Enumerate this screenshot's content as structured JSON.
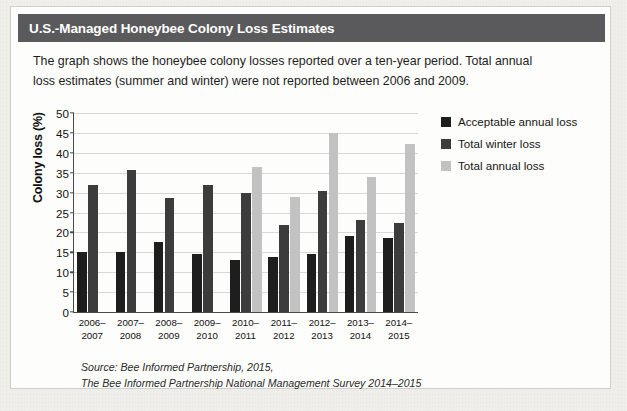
{
  "header": {
    "title": "U.S.-Managed Honeybee Colony Loss Estimates"
  },
  "description": {
    "line1": "The graph shows the honeybee colony losses reported over a ten-year period. Total annual",
    "line2": "loss estimates (summer and winter) were not reported between 2006 and 2009."
  },
  "source": {
    "line1": "Source: Bee Informed Partnership, 2015,",
    "line2": "The Bee Informed Partnership National Management Survey 2014–2015"
  },
  "legend": {
    "items": [
      {
        "label": "Acceptable annual loss",
        "color": "#1e1e1e",
        "key": "acceptable"
      },
      {
        "label": "Total winter loss",
        "color": "#3c3c3c",
        "key": "winter"
      },
      {
        "label": "Total annual loss",
        "color": "#c2c2c2",
        "key": "annual"
      }
    ]
  },
  "chart_data": {
    "type": "bar",
    "title": "U.S.-Managed Honeybee Colony Loss Estimates",
    "xlabel": "",
    "ylabel": "Colony loss (%)",
    "ylim": [
      0,
      50
    ],
    "ytick_step": 5,
    "yticks": [
      0,
      5,
      10,
      15,
      20,
      25,
      30,
      35,
      40,
      45,
      50
    ],
    "ytick_labels": [
      "0",
      "5",
      "10",
      "15",
      "20",
      "25",
      "30",
      "35",
      "40",
      "45",
      "50"
    ],
    "grid": true,
    "legend_position": "right-top",
    "categories": [
      "2006–2007",
      "2007–2008",
      "2008–2009",
      "2009–2010",
      "2010–2011",
      "2011–2012",
      "2012–2013",
      "2013–2014",
      "2014–2015"
    ],
    "category_lines": [
      [
        "2006–",
        "2007"
      ],
      [
        "2007–",
        "2008"
      ],
      [
        "2008–",
        "2009"
      ],
      [
        "2009–",
        "2010"
      ],
      [
        "2010–",
        "2011"
      ],
      [
        "2011–",
        "2012"
      ],
      [
        "2012–",
        "2013"
      ],
      [
        "2013–",
        "2014"
      ],
      [
        "2014–",
        "2015"
      ]
    ],
    "series": [
      {
        "name": "Acceptable annual loss",
        "key": "acceptable",
        "color": "#1e1e1e",
        "values": [
          15.0,
          15.0,
          17.5,
          14.5,
          13.0,
          13.8,
          14.6,
          19.0,
          18.7
        ]
      },
      {
        "name": "Total winter loss",
        "key": "winter",
        "color": "#3c3c3c",
        "values": [
          31.8,
          35.6,
          28.6,
          32.0,
          30.0,
          21.9,
          30.5,
          23.2,
          22.4
        ]
      },
      {
        "name": "Total annual loss",
        "key": "annual",
        "color": "#c2c2c2",
        "values": [
          null,
          null,
          null,
          null,
          36.4,
          28.9,
          45.1,
          34.0,
          42.1
        ]
      }
    ]
  }
}
